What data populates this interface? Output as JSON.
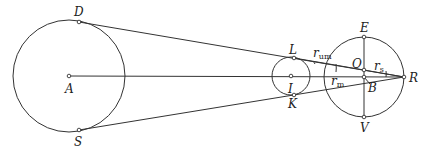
{
  "diagram": {
    "type": "geometric-construction",
    "circles": [
      {
        "id": "A",
        "label": "A",
        "cx": 69,
        "cy": 76,
        "r": 56
      },
      {
        "id": "I",
        "label": "I",
        "cx": 291,
        "cy": 76,
        "r": 19
      },
      {
        "id": "O",
        "cx": 364,
        "cy": 77,
        "r": 40
      }
    ],
    "points": {
      "D": {
        "label": "D",
        "x": 79,
        "y": 22
      },
      "S": {
        "label": "S",
        "x": 79,
        "y": 130
      },
      "A": {
        "label": "A",
        "x": 69,
        "y": 76
      },
      "L": {
        "label": "L",
        "x": 294,
        "y": 58
      },
      "I": {
        "label": "I",
        "x": 291,
        "y": 76
      },
      "K": {
        "label": "K",
        "x": 294,
        "y": 95
      },
      "E": {
        "label": "E",
        "x": 364,
        "y": 37
      },
      "O": {
        "label": "O",
        "x": 364,
        "y": 70
      },
      "B": {
        "label": "B",
        "x": 364,
        "y": 77
      },
      "V": {
        "label": "V",
        "x": 364,
        "y": 117
      },
      "R": {
        "label": "R",
        "x": 404,
        "y": 77
      }
    },
    "labels": {
      "D": "D",
      "A": "A",
      "S": "S",
      "L": "L",
      "I": "I",
      "K": "K",
      "E": "E",
      "O": "O",
      "B": "B",
      "V": "V",
      "R": "R",
      "r_um": {
        "base": "r",
        "sub": "um"
      },
      "r_m": {
        "base": "r",
        "sub": "m"
      },
      "r_s": {
        "base": "r",
        "sub": "s"
      }
    }
  }
}
